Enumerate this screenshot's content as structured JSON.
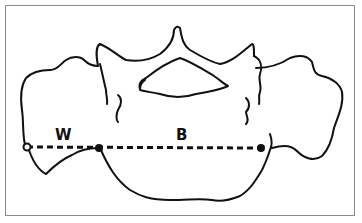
{
  "diagram": {
    "labels": {
      "w": "W",
      "b": "B"
    },
    "measurement_line": {
      "style": "dashed",
      "points": [
        {
          "name": "left-end",
          "marker": "open-circle"
        },
        {
          "name": "middle",
          "marker": "filled-circle"
        },
        {
          "name": "right-end",
          "marker": "filled-circle"
        }
      ]
    },
    "colors": {
      "stroke": "#111111",
      "frame": "#8a8a8a",
      "background": "#ffffff"
    }
  }
}
